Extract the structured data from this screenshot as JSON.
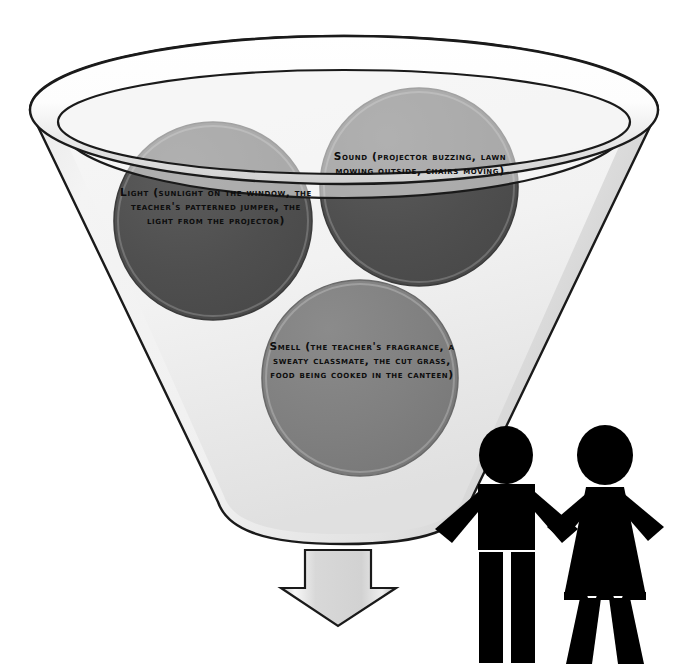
{
  "diagram": {
    "type": "funnel-diagram",
    "background_color": "#ffffff"
  },
  "funnel": {
    "name": "funnel",
    "body_fill_light": "#f2f2f2",
    "body_fill_dark": "#d4d4d4",
    "outline_color": "#1a1a1a",
    "rim_fill_light": "#ffffff",
    "rim_fill_dark": "#d0d0d0"
  },
  "circles": [
    {
      "id": "light",
      "name": "light-circle",
      "label": "Light (sunlight on the window, the teacher's patterned jumper, the light from the projector)",
      "fill": "#4f4f4f",
      "stroke": "#3a3a3a",
      "cx": 213,
      "cy": 221,
      "r": 99
    },
    {
      "id": "sound",
      "name": "sound-circle",
      "label": "Sound (projector buzzing, lawn mowing outside, chairs moving)",
      "fill": "#4f4f4f",
      "stroke": "#3a3a3a",
      "cx": 419,
      "cy": 187,
      "r": 99
    },
    {
      "id": "smell",
      "name": "smell-circle",
      "label": "Smell (the teacher's fragrance, a sweaty classmate, the cut grass, food being cooked in the canteen)",
      "fill": "#808080",
      "stroke": "#6a6a6a",
      "cx": 360,
      "cy": 378,
      "r": 98
    }
  ],
  "arrow": {
    "name": "down-arrow",
    "direction": "down",
    "fill_light": "#fafafa",
    "fill_dark": "#bdbdbd",
    "outline_color": "#1a1a1a"
  },
  "people": [
    {
      "id": "male",
      "name": "male-figure",
      "fill": "#000000"
    },
    {
      "id": "female",
      "name": "female-figure",
      "fill": "#000000"
    }
  ]
}
